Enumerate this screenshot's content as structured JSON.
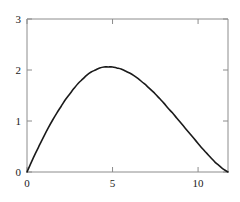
{
  "chart_data": {
    "type": "line",
    "title": "",
    "subtitle": "",
    "xlabel": "",
    "ylabel": "",
    "xlim": [
      0,
      11.75
    ],
    "ylim": [
      0,
      3
    ],
    "grid": false,
    "legend": false,
    "legend_position": "none",
    "xticks": [
      0,
      5,
      10
    ],
    "xtick_labels": [
      "0",
      "5",
      "10"
    ],
    "yticks": [
      0,
      1,
      2,
      3
    ],
    "ytick_labels": [
      "0",
      "1",
      "2",
      "3"
    ],
    "annotations": [],
    "series": [
      {
        "name": "curve",
        "color": "#1a1a1a",
        "line_width": 1.6,
        "x": [
          0.0,
          0.25,
          0.5,
          0.75,
          1.0,
          1.25,
          1.5,
          1.75,
          2.0,
          2.25,
          2.5,
          2.75,
          3.0,
          3.25,
          3.5,
          3.75,
          4.0,
          4.25,
          4.5,
          4.75,
          5.0,
          5.25,
          5.5,
          5.75,
          6.0,
          6.25,
          6.5,
          6.75,
          7.0,
          7.25,
          7.5,
          7.75,
          8.0,
          8.25,
          8.5,
          8.75,
          9.0,
          9.25,
          9.5,
          9.75,
          10.0,
          10.25,
          10.5,
          10.75,
          11.0,
          11.25,
          11.5,
          11.75
        ],
        "y": [
          0.0,
          0.19,
          0.37,
          0.54,
          0.71,
          0.87,
          1.02,
          1.16,
          1.29,
          1.42,
          1.53,
          1.64,
          1.74,
          1.82,
          1.9,
          1.96,
          2.0,
          2.04,
          2.06,
          2.06,
          2.06,
          2.04,
          2.02,
          1.98,
          1.94,
          1.89,
          1.83,
          1.76,
          1.69,
          1.61,
          1.53,
          1.44,
          1.35,
          1.25,
          1.16,
          1.06,
          0.96,
          0.86,
          0.76,
          0.66,
          0.56,
          0.46,
          0.37,
          0.28,
          0.19,
          0.12,
          0.05,
          0.0
        ]
      }
    ],
    "peak": {
      "x": 4.85,
      "y": 2.06
    },
    "zeros": [
      0.0,
      11.75
    ],
    "axis_color": "#8c8c8c",
    "frame_color": "#8c8c8c",
    "background": "#ffffff",
    "plot_box": {
      "left": 27,
      "right": 228,
      "top": 19,
      "bottom": 172
    }
  }
}
